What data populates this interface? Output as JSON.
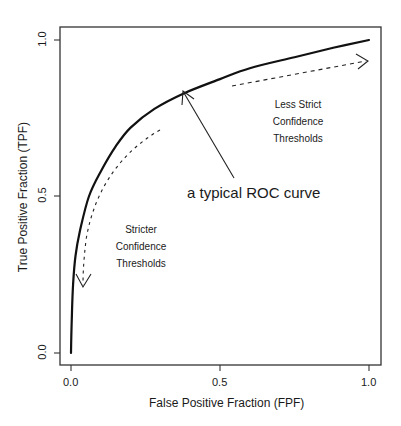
{
  "chart_data": {
    "type": "line",
    "title": "",
    "xlabel": "False Positive Fraction (FPF)",
    "ylabel": "True Positive Fraction (TPF)",
    "xlim": [
      0,
      1
    ],
    "ylim": [
      0,
      1
    ],
    "grid": false,
    "x_ticks": [
      "0.0",
      "0.5",
      "1.0"
    ],
    "y_ticks": [
      "0.0",
      "0.5",
      "1.0"
    ],
    "series": [
      {
        "name": "ROC curve",
        "style": "solid",
        "x": [
          0.0,
          0.003,
          0.007,
          0.015,
          0.03,
          0.06,
          0.1,
          0.15,
          0.2,
          0.28,
          0.38,
          0.5,
          0.6,
          0.75,
          0.88,
          1.0
        ],
        "y": [
          0.0,
          0.12,
          0.22,
          0.31,
          0.39,
          0.5,
          0.58,
          0.66,
          0.72,
          0.78,
          0.83,
          0.875,
          0.91,
          0.945,
          0.975,
          1.0
        ]
      }
    ],
    "annotations": [
      {
        "text": "a typical ROC curve",
        "type": "arrow-callout",
        "points_to": [
          0.38,
          0.83
        ]
      },
      {
        "text": "Stricter\nConfidence\nThresholds",
        "type": "dashed-arrow",
        "direction": "toward origin"
      },
      {
        "text": "Less Strict\nConfidence\nThresholds",
        "type": "dashed-arrow",
        "direction": "toward (1,1)"
      }
    ]
  },
  "axes": {
    "x_ticks": [
      "0.0",
      "0.5",
      "1.0"
    ],
    "y_ticks": [
      "0.0",
      "0.5",
      "1.0"
    ],
    "xlabel": "False Positive Fraction (FPF)",
    "ylabel": "True Positive Fraction (TPF)"
  },
  "annotations": {
    "callout": "a typical ROC curve",
    "stricter": [
      "Stricter",
      "Confidence",
      "Thresholds"
    ],
    "less_strict": [
      "Less Strict",
      "Confidence",
      "Thresholds"
    ]
  },
  "colors": {
    "line": "#111111",
    "frame": "#333333",
    "background": "#ffffff"
  }
}
